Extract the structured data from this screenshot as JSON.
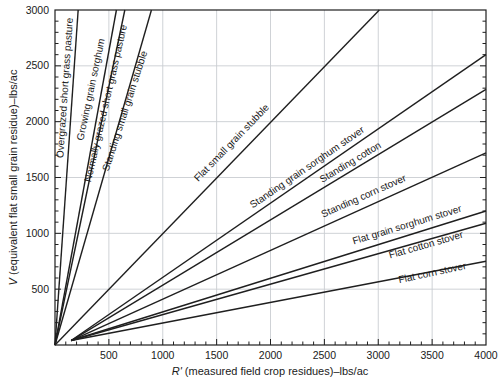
{
  "chart_data": {
    "type": "line",
    "title": "",
    "xlabel": {
      "symbol": "R'",
      "rest": " (measured field crop residues)–lbs/ac"
    },
    "ylabel": {
      "symbol": "V",
      "rest": " (equivalent flat small grain residue)–lbs/ac"
    },
    "xlim": [
      0,
      4000
    ],
    "ylim": [
      0,
      3000
    ],
    "x_tick_labels": [
      500,
      1000,
      1500,
      2000,
      2500,
      3000,
      3500,
      4000
    ],
    "y_tick_labels": [
      500,
      1000,
      1500,
      2000,
      2500,
      3000
    ],
    "minor_tick_step": 100,
    "grid_step": 500,
    "grid": true,
    "legend_position": "labels-on-lines",
    "colors": {
      "line": "#1f1f1f",
      "frame": "#1f1f1f",
      "grid": "#c9cdd1",
      "text": "#1a1a1a"
    },
    "series": [
      {
        "name": "Overgrazed short grass pasture",
        "points": [
          [
            0,
            0
          ],
          [
            215,
            3000
          ]
        ],
        "label": {
          "x": 121,
          "y": 2300,
          "angle": -86
        }
      },
      {
        "name": "Growing grain sorghum",
        "points": [
          [
            0,
            0
          ],
          [
            570,
            3000
          ]
        ],
        "label": {
          "x": 362,
          "y": 2283,
          "angle": -78
        }
      },
      {
        "name": "Normally grazed short grass pasture",
        "points": [
          [
            0,
            0
          ],
          [
            648,
            3000
          ]
        ],
        "label": {
          "x": 501,
          "y": 2158,
          "angle": -77
        }
      },
      {
        "name": "Standing small grain stubble",
        "points": [
          [
            0,
            0
          ],
          [
            895,
            3000
          ]
        ],
        "label": {
          "x": 677,
          "y": 2087,
          "angle": -72
        }
      },
      {
        "name": "Flat small grain stubble",
        "points": [
          [
            0,
            0
          ],
          [
            3010,
            3000
          ]
        ],
        "label": {
          "x": 1661,
          "y": 1791,
          "angle": -46
        }
      },
      {
        "name": "Standing grain sorghum stover",
        "points": [
          [
            150,
            40
          ],
          [
            4000,
            2600
          ]
        ],
        "label": {
          "x": 2357,
          "y": 1567,
          "angle": -34.5
        }
      },
      {
        "name": "Standing cotton",
        "points": [
          [
            150,
            40
          ],
          [
            4000,
            2290
          ]
        ],
        "label": {
          "x": 2756,
          "y": 1612,
          "angle": -31
        }
      },
      {
        "name": "Standing corn stover",
        "points": [
          [
            150,
            40
          ],
          [
            4000,
            1720
          ]
        ],
        "label": {
          "x": 2877,
          "y": 1307,
          "angle": -24
        }
      },
      {
        "name": "Flat grain sorghum stover",
        "points": [
          [
            150,
            40
          ],
          [
            4000,
            1200
          ]
        ],
        "label": {
          "x": 3276,
          "y": 1048,
          "angle": -17
        }
      },
      {
        "name": "Flat cotton stover",
        "points": [
          [
            150,
            40
          ],
          [
            4000,
            1090
          ]
        ],
        "label": {
          "x": 3452,
          "y": 869,
          "angle": -16
        }
      },
      {
        "name": "Flat corn stover",
        "points": [
          [
            150,
            40
          ],
          [
            4000,
            750
          ]
        ],
        "label": {
          "x": 3508,
          "y": 618,
          "angle": -12
        }
      }
    ]
  }
}
